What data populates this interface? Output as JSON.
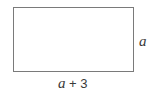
{
  "diagram": {
    "shape": "rectangle",
    "side_label": "a",
    "bottom_label": {
      "variable": "a",
      "rest": " + 3"
    },
    "stroke_color": "#7a7a7a",
    "text_color": "#3a3a3a"
  }
}
